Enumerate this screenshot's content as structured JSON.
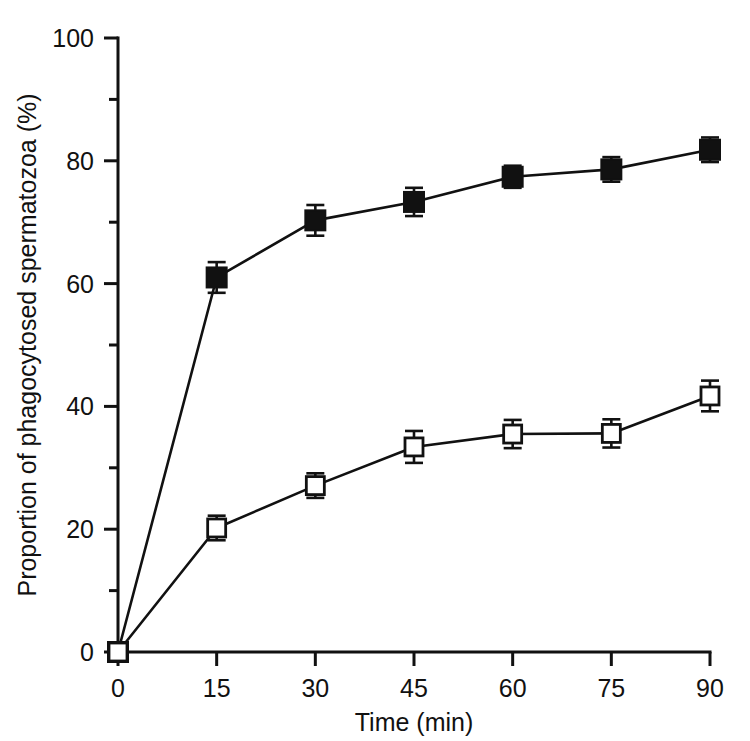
{
  "chart_data": {
    "type": "line",
    "title": "",
    "subtitle": "",
    "xlabel": "Time (min)",
    "ylabel": "Proportion of phagocytosed spermatozoa (%)",
    "xlim": [
      0,
      90
    ],
    "ylim": [
      0,
      100
    ],
    "grid": false,
    "legend_position": "none",
    "x": [
      0,
      15,
      30,
      45,
      60,
      75,
      90
    ],
    "xticks": [
      "0",
      "15",
      "30",
      "45",
      "60",
      "75",
      "90"
    ],
    "yticks": [
      "0",
      "20",
      "40",
      "60",
      "80",
      "100"
    ],
    "ytick_values": [
      0,
      20,
      40,
      60,
      80,
      100
    ],
    "yminor_values": [
      10,
      30,
      50,
      70,
      90
    ],
    "series": [
      {
        "name": "filled-square-series",
        "marker": "filled-square",
        "values": [
          0,
          61,
          70.3,
          73.3,
          77.4,
          78.6,
          81.8
        ],
        "errors": [
          0,
          2.5,
          2.5,
          2.3,
          1.8,
          2.0,
          2.0
        ]
      },
      {
        "name": "open-square-series",
        "marker": "open-square",
        "values": [
          0,
          20.2,
          27.1,
          33.4,
          35.5,
          35.6,
          41.7
        ],
        "errors": [
          0,
          2.0,
          2.0,
          2.6,
          2.3,
          2.3,
          2.5
        ]
      }
    ],
    "annotations": []
  },
  "figure": {
    "background_color": "#ffffff",
    "ink_color": "#111111"
  }
}
